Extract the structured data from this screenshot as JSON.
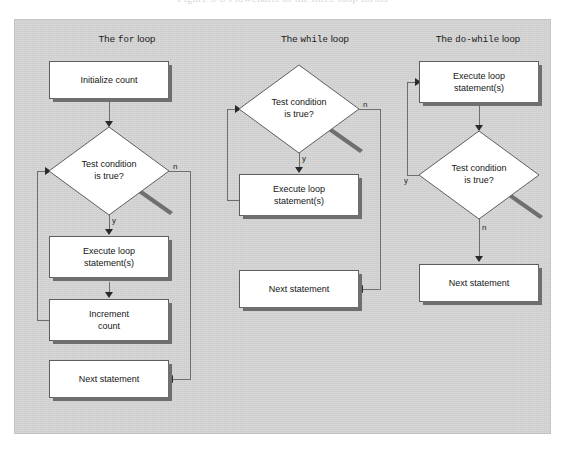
{
  "figure": {
    "top_caption": "Figure 5-8  Flowcharts of the three loop forms",
    "background_color": "#d4d4d4",
    "node_fill": "#ffffff",
    "node_border": "#5e5e5e",
    "shadow_color": "#6f6f6f",
    "connector_color": "#6e6e6e"
  },
  "columns": [
    {
      "id": "for-loop",
      "title_prefix": "The ",
      "title_keyword": "for",
      "title_suffix": " loop",
      "nodes": [
        {
          "id": "initialize-count",
          "type": "process",
          "label": "Initialize count"
        },
        {
          "id": "test-condition",
          "type": "decision",
          "label_line1": "Test condition",
          "label_line2": "is true?"
        },
        {
          "id": "execute-loop",
          "type": "process",
          "label_line1": "Execute loop",
          "label_line2": "statement(s)"
        },
        {
          "id": "increment-count",
          "type": "process",
          "label_line1": "Increment",
          "label_line2": "count"
        },
        {
          "id": "next-statement",
          "type": "process",
          "label": "Next statement"
        }
      ],
      "edge_labels": {
        "no": "n",
        "yes": "y"
      }
    },
    {
      "id": "while-loop",
      "title_prefix": "The ",
      "title_keyword": "while",
      "title_suffix": " loop",
      "nodes": [
        {
          "id": "test-condition",
          "type": "decision",
          "label_line1": "Test condition",
          "label_line2": "is true?"
        },
        {
          "id": "execute-loop",
          "type": "process",
          "label_line1": "Execute loop",
          "label_line2": "statement(s)"
        },
        {
          "id": "next-statement",
          "type": "process",
          "label": "Next statement"
        }
      ],
      "edge_labels": {
        "no": "n",
        "yes": "y"
      }
    },
    {
      "id": "do-while-loop",
      "title_prefix": "The ",
      "title_keyword": "do-while",
      "title_suffix": " loop",
      "nodes": [
        {
          "id": "execute-loop",
          "type": "process",
          "label_line1": "Execute loop",
          "label_line2": "statement(s)"
        },
        {
          "id": "test-condition",
          "type": "decision",
          "label_line1": "Test condition",
          "label_line2": "is true?"
        },
        {
          "id": "next-statement",
          "type": "process",
          "label": "Next statement"
        }
      ],
      "edge_labels": {
        "no": "n",
        "yes": "y"
      }
    }
  ]
}
